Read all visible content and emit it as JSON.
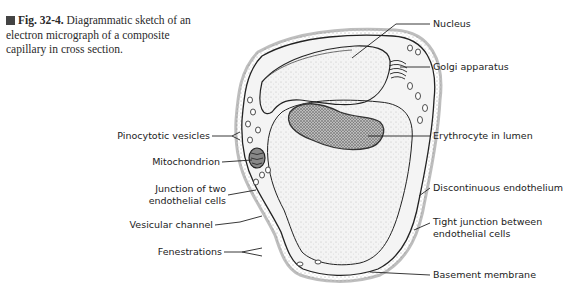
{
  "caption": {
    "fig_label": "Fig. 32-4.",
    "text": "Diagrammatic sketch of an electron micrograph of a composite capillary in cross section."
  },
  "labels": {
    "nucleus": "Nucleus",
    "golgi": "Golgi apparatus",
    "erythrocyte": "Erythrocyte in lumen",
    "pinocytotic": "Pinocytotic vesicles",
    "mitochondrion": "Mitochondrion",
    "junction_line1": "Junction of two",
    "junction_line2": "endothelial cells",
    "discontinuous": "Discontinuous endothelium",
    "tight_line1": "Tight junction between",
    "tight_line2": "endothelial cells",
    "vesicular": "Vesicular channel",
    "fenestrations": "Fenestrations",
    "basement": "Basement membrane"
  }
}
